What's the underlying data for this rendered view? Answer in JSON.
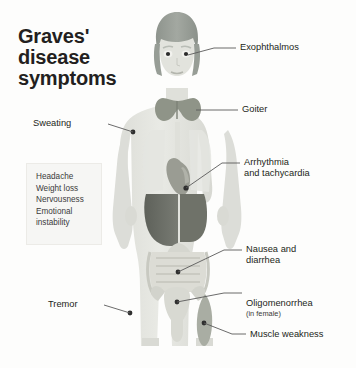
{
  "title": {
    "line1": "Graves'",
    "line2": "disease",
    "line3": "symptoms"
  },
  "symptom_box": {
    "items": [
      "Headache",
      "Weight loss",
      "Nervousness",
      "Emotional\ninstability"
    ]
  },
  "callouts": {
    "sweating": "Sweating",
    "tremor": "Tremor",
    "exophthalmos": "Exophthalmos",
    "goiter": "Goiter",
    "arrhythmia": "Arrhythmia\nand tachycardia",
    "nausea": "Nausea and\ndiarrhea",
    "oligomenorrhea": "Oligomenorrhea",
    "oligomenorrhea_sub": "(in female)",
    "muscle_weakness": "Muscle weakness"
  },
  "colors": {
    "background": "#fdfdfc",
    "title_text": "#231f20",
    "body_fill": "#e6e7e3",
    "body_shade": "#dcddd8",
    "hair": "#9aa09a",
    "skin": "#dfe0da",
    "thyroid": "#8f9488",
    "heart": "#9a9c93",
    "liver": "#6c6f68",
    "intestine": "#cfd0c9",
    "uterus": "#d3d4cd",
    "muscle": "#a9ada3",
    "leader_line": "#5a5a5a",
    "box_fill": "#f6f6f4",
    "box_border": "#ecebe7"
  }
}
